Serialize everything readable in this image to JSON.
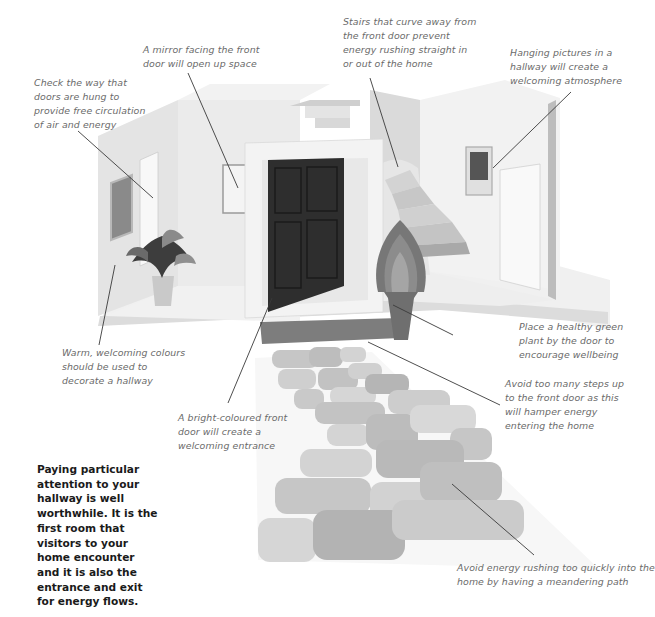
{
  "diagram": {
    "intro_text": [
      "Paying particular",
      "attention to your",
      "hallway is well",
      "worthwhile. It is the",
      "first room that",
      "visitors to your",
      "home encounter",
      "and it is also the",
      "entrance and exit",
      "for energy flows."
    ],
    "annotations": {
      "mirror": [
        "A mirror facing the front",
        "door will open up space"
      ],
      "doors_hung": [
        "Check the way that",
        "doors are hung to",
        "provide free circulation",
        "of air and energy"
      ],
      "stairs": [
        "Stairs that curve away from",
        "the front door prevent",
        "energy rushing straight in",
        "or out of the home"
      ],
      "pictures": [
        "Hanging pictures in a",
        "hallway will create a",
        "welcoming atmosphere"
      ],
      "colours": [
        "Warm, welcoming colours",
        "should be used to",
        "decorate a hallway"
      ],
      "plant": [
        "Place a healthy green",
        "plant by the door to",
        "encourage wellbeing"
      ],
      "steps": [
        "Avoid too many steps up",
        "to the front door as this",
        "will hamper energy",
        "entering the home"
      ],
      "front_door": [
        "A bright-coloured front",
        "door will create a",
        "welcoming entrance"
      ],
      "path": [
        "Avoid energy rushing too quickly into the",
        "home by having a meandering path"
      ]
    },
    "colors": {
      "wall": "#e9e9e9",
      "wall_shade": "#d2d2d2",
      "floor": "#eeeeee",
      "door": "#2e2e2e",
      "plant_outer": "#777777",
      "plant_mid": "#8c8c8c",
      "plant_inner": "#a5a5a5",
      "pot": "#6f6f6f",
      "step": "#7a7a7a",
      "stone_light": "#cfcfcf",
      "stone_mid": "#bdbdbd",
      "stone_dark": "#adadad",
      "leader_line": "#3a3a3a",
      "note_text": "#6a6a6a",
      "intro_text": "#1a1a1a"
    }
  }
}
